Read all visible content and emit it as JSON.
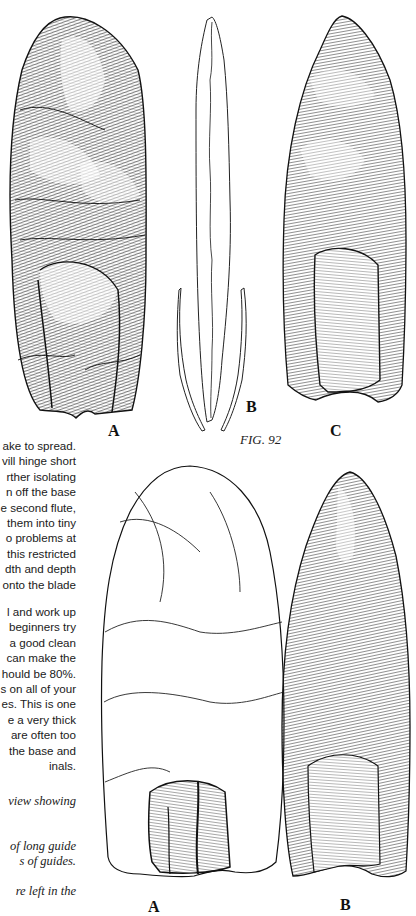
{
  "figure": {
    "number_label": "FIG. 92",
    "top_row_labels": [
      "A",
      "B",
      "C"
    ],
    "bottom_row_labels": [
      "A",
      "B"
    ]
  },
  "body_text": {
    "lines": [
      "ake to spread.",
      "vill hinge short",
      "rther isolating",
      "n off the base",
      "e second flute,",
      "them into tiny",
      "o problems at",
      "this restricted",
      "dth and depth",
      "onto the blade"
    ],
    "paragraph2": [
      "l and work up",
      "beginners try",
      "a good clean",
      "can make the",
      "hould be 80%.",
      "s on all of your",
      "es. This is one",
      "e a very thick",
      "are often too",
      "the base and",
      "inals."
    ]
  },
  "captions": {
    "lines": [
      "view  showing",
      "",
      "",
      "of  long guide",
      "s of guides.",
      "",
      "re  left  in the"
    ]
  },
  "illustrations": [
    {
      "id": "top-a",
      "description": "Fluted point, dense hatched flake scars"
    },
    {
      "id": "top-b",
      "description": "Outline of channel flake with guide flakes"
    },
    {
      "id": "top-c",
      "description": "Fluted point with large flute scar at base"
    },
    {
      "id": "bottom-a",
      "description": "Outline drawing of point showing flute scars at base"
    },
    {
      "id": "bottom-b",
      "description": "Heavily hatched fluted point"
    }
  ]
}
